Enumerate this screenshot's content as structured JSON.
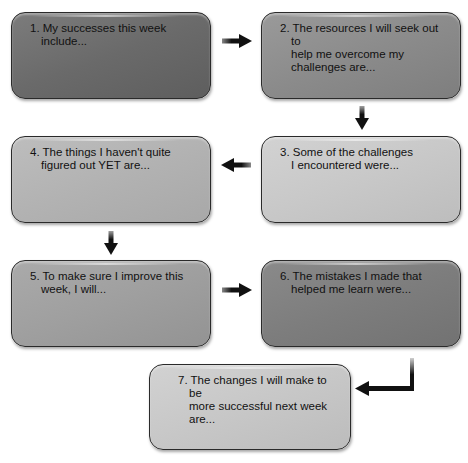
{
  "diagram": {
    "type": "flowchart",
    "boxes": [
      {
        "id": 1,
        "text": "1. My successes this week include...",
        "fill": "#6f6f6f"
      },
      {
        "id": 2,
        "text": "2. The resources I will seek out to\nhelp me overcome my\nchallenges are...",
        "fill": "#8d8d8d"
      },
      {
        "id": 3,
        "text": "3. Some of the challenges\nI encountered were...",
        "fill": "#c9c9c9"
      },
      {
        "id": 4,
        "text": "4. The things I haven't quite\nfigured out YET are...",
        "fill": "#b3b3b3"
      },
      {
        "id": 5,
        "text": "5. To make sure I improve this\nweek, I will...",
        "fill": "#a0a0a0"
      },
      {
        "id": 6,
        "text": "6. The mistakes I made that\nhelped me learn were...",
        "fill": "#7e7e7e"
      },
      {
        "id": 7,
        "text": "7. The changes I will make to be\nmore successful next week are...",
        "fill": "#c8c8c8"
      }
    ],
    "arrows": [
      {
        "from": 1,
        "to": 2,
        "direction": "right"
      },
      {
        "from": 2,
        "to": 3,
        "direction": "down"
      },
      {
        "from": 3,
        "to": 4,
        "direction": "left"
      },
      {
        "from": 4,
        "to": 5,
        "direction": "down"
      },
      {
        "from": 5,
        "to": 6,
        "direction": "right"
      },
      {
        "from": 6,
        "to": 7,
        "direction": "elbow-down-left"
      }
    ],
    "colors": {
      "border": "#2a2a2a",
      "arrow": "#111111",
      "text": "#111111"
    }
  }
}
